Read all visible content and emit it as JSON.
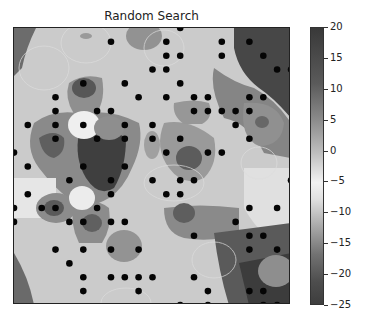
{
  "chart_data": {
    "type": "heatmap",
    "title": "Random Search",
    "xlabel": "",
    "ylabel": "",
    "colormap": "gray diverging (dark at extremes, light near -2)",
    "colorbar": {
      "ticks": [
        20,
        15,
        10,
        5,
        0,
        -5,
        -10,
        -15,
        -20,
        -25
      ],
      "range": [
        -25,
        20
      ]
    },
    "grid": false,
    "axes_ticks_visible": false,
    "sample_grid": {
      "cols": 21,
      "rows": 21,
      "note": "scatter points on a 20x20-spaced grid, indices (col,row) from top-left"
    },
    "scatter_points": [
      [
        12,
        0
      ],
      [
        7,
        1
      ],
      [
        11,
        1
      ],
      [
        15,
        1
      ],
      [
        17,
        1
      ],
      [
        11,
        2
      ],
      [
        12,
        2
      ],
      [
        15,
        2
      ],
      [
        18,
        2
      ],
      [
        10,
        3
      ],
      [
        11,
        3
      ],
      [
        19,
        3
      ],
      [
        20,
        3
      ],
      [
        5,
        4
      ],
      [
        8,
        4
      ],
      [
        12,
        4
      ],
      [
        3,
        5
      ],
      [
        9,
        5
      ],
      [
        11,
        5
      ],
      [
        13,
        5
      ],
      [
        14,
        5
      ],
      [
        17,
        5
      ],
      [
        18,
        5
      ],
      [
        3,
        6
      ],
      [
        6,
        6
      ],
      [
        7,
        6
      ],
      [
        13,
        6
      ],
      [
        14,
        6
      ],
      [
        15,
        6
      ],
      [
        16,
        6
      ],
      [
        17,
        6
      ],
      [
        1,
        7
      ],
      [
        3,
        7
      ],
      [
        5,
        7
      ],
      [
        8,
        7
      ],
      [
        10,
        7
      ],
      [
        16,
        7
      ],
      [
        3,
        8
      ],
      [
        6,
        8
      ],
      [
        8,
        8
      ],
      [
        10,
        8
      ],
      [
        12,
        8
      ],
      [
        17,
        8
      ],
      [
        0,
        9
      ],
      [
        11,
        9
      ],
      [
        14,
        9
      ],
      [
        15,
        9
      ],
      [
        1,
        10
      ],
      [
        5,
        10
      ],
      [
        8,
        10
      ],
      [
        4,
        11
      ],
      [
        7,
        11
      ],
      [
        10,
        11
      ],
      [
        12,
        11
      ],
      [
        13,
        11
      ],
      [
        20,
        11
      ],
      [
        1,
        12
      ],
      [
        7,
        12
      ],
      [
        11,
        12
      ],
      [
        12,
        12
      ],
      [
        0,
        13
      ],
      [
        2,
        13
      ],
      [
        3,
        13
      ],
      [
        6,
        13
      ],
      [
        17,
        13
      ],
      [
        19,
        13
      ],
      [
        0,
        14
      ],
      [
        4,
        14
      ],
      [
        5,
        14
      ],
      [
        7,
        14
      ],
      [
        8,
        14
      ],
      [
        16,
        14
      ],
      [
        13,
        15
      ],
      [
        17,
        15
      ],
      [
        18,
        15
      ],
      [
        3,
        16
      ],
      [
        5,
        16
      ],
      [
        7,
        16
      ],
      [
        9,
        16
      ],
      [
        17,
        16
      ],
      [
        19,
        16
      ],
      [
        4,
        17
      ],
      [
        5,
        18
      ],
      [
        7,
        18
      ],
      [
        8,
        18
      ],
      [
        9,
        18
      ],
      [
        10,
        18
      ],
      [
        13,
        18
      ],
      [
        5,
        19
      ],
      [
        9,
        19
      ],
      [
        14,
        19
      ],
      [
        17,
        19
      ],
      [
        18,
        19
      ],
      [
        12,
        20
      ],
      [
        14,
        20
      ],
      [
        18,
        20
      ],
      [
        19,
        20
      ]
    ],
    "regions": [
      {
        "desc": "dark blob (about -20)",
        "center": [
          6,
          10
        ],
        "value": -20
      },
      {
        "desc": "dark region top-right (about +18)",
        "center": [
          18,
          1
        ],
        "value": 18
      },
      {
        "desc": "dark region bottom-right (about +15)",
        "center": [
          19,
          19
        ],
        "value": 15
      },
      {
        "desc": "light spot (about -3)",
        "center": [
          5,
          7
        ],
        "value": -3
      },
      {
        "desc": "background",
        "value": -8
      }
    ]
  }
}
